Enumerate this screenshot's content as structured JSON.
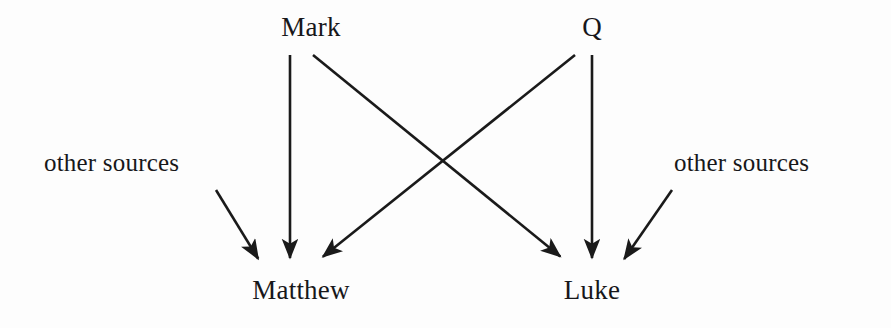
{
  "diagram": {
    "background_color": "#fdfdfd",
    "ink_color": "#1a1a1a",
    "nodes": [
      {
        "id": "mark",
        "label": "Mark",
        "x": 311,
        "y": 28
      },
      {
        "id": "q",
        "label": "Q",
        "x": 592,
        "y": 28
      },
      {
        "id": "src_left",
        "label": "other sources",
        "x": 113,
        "y": 163
      },
      {
        "id": "src_right",
        "label": "other sources",
        "x": 767,
        "y": 163
      },
      {
        "id": "matthew",
        "label": "Matthew",
        "x": 301,
        "y": 291
      },
      {
        "id": "luke",
        "label": "Luke",
        "x": 592,
        "y": 291
      }
    ],
    "edges": [
      {
        "id": "mark-to-matthew",
        "from": "mark",
        "to": "matthew",
        "x1": 290,
        "y1": 55,
        "x2": 290,
        "y2": 265
      },
      {
        "id": "mark-to-luke",
        "from": "mark",
        "to": "luke",
        "x1": 313,
        "y1": 55,
        "x2": 565,
        "y2": 265
      },
      {
        "id": "q-to-matthew",
        "from": "q",
        "to": "matthew",
        "x1": 575,
        "y1": 55,
        "x2": 318,
        "y2": 265
      },
      {
        "id": "q-to-luke",
        "from": "q",
        "to": "luke",
        "x1": 592,
        "y1": 55,
        "x2": 592,
        "y2": 265
      },
      {
        "id": "othersources-to-matthew",
        "from": "src_left",
        "to": "matthew",
        "x1": 216,
        "y1": 190,
        "x2": 262,
        "y2": 265
      },
      {
        "id": "othersources-to-luke",
        "from": "src_right",
        "to": "luke",
        "x1": 672,
        "y1": 190,
        "x2": 620,
        "y2": 265
      }
    ],
    "crossing_point": {
      "x": 441,
      "y": 163
    }
  }
}
